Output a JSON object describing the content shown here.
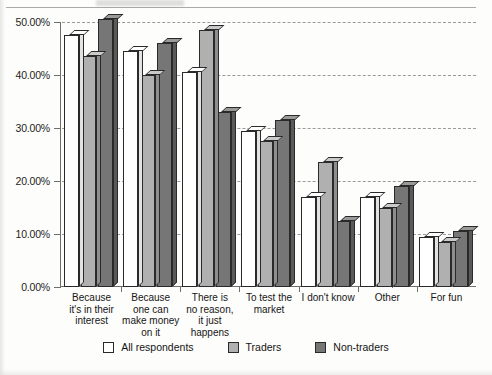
{
  "chart_data": {
    "type": "bar",
    "title": "",
    "xlabel": "",
    "ylabel": "",
    "ylim": [
      0,
      50
    ],
    "grid": true,
    "legend_position": "bottom",
    "ytick_labels": [
      "0.00%",
      "10.00%",
      "20.00%",
      "30.00%",
      "40.00%",
      "50.00%"
    ],
    "ytick_values": [
      0,
      10,
      20,
      30,
      40,
      50
    ],
    "categories": [
      "Because\nit's in their\ninterest",
      "Because\none can\nmake money\non it",
      "There is\nno reason,\nit just\nhappens",
      "To test the\nmarket",
      "I don't know",
      "Other",
      "For fun"
    ],
    "series": [
      {
        "name": "All respondents",
        "color": "#ffffff",
        "values": [
          47.5,
          44.5,
          40.5,
          29.5,
          17.0,
          17.0,
          9.5
        ]
      },
      {
        "name": "Traders",
        "color": "#b0b0b0",
        "values": [
          43.5,
          40.0,
          48.5,
          27.5,
          23.5,
          15.0,
          8.5
        ]
      },
      {
        "name": "Non-traders",
        "color": "#767676",
        "values": [
          50.5,
          46.0,
          33.0,
          31.5,
          12.5,
          19.0,
          10.5
        ]
      }
    ]
  },
  "legend": {
    "items": [
      {
        "label": "All respondents"
      },
      {
        "label": "Traders"
      },
      {
        "label": "Non-traders"
      }
    ]
  }
}
